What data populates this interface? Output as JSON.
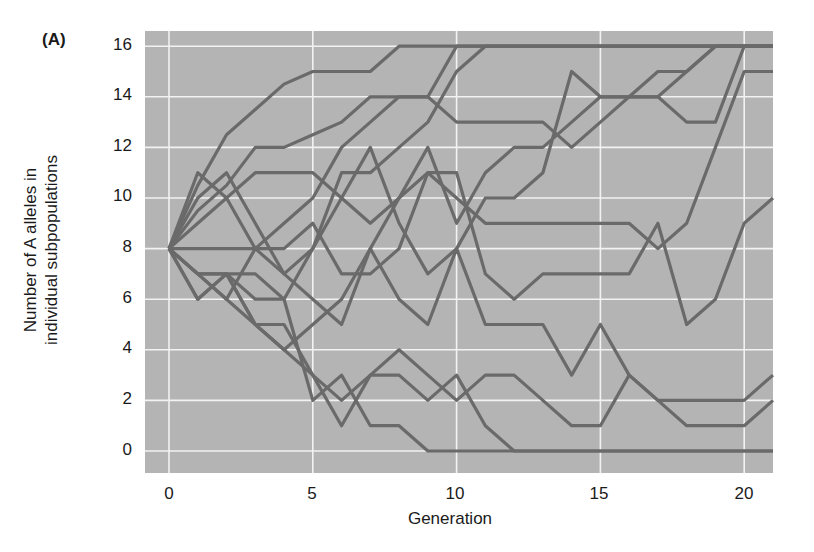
{
  "panel_label": "(A)",
  "chart_data": {
    "type": "line",
    "title": "",
    "xlabel": "Generation",
    "ylabel_line1": "Number of A alleles in",
    "ylabel_line2": "individual subpopulations",
    "xlim": [
      -0.85,
      21
    ],
    "ylim": [
      -0.9,
      16.6
    ],
    "grid": true,
    "legend": "none",
    "x_ticks": [
      0,
      5,
      10,
      15,
      20
    ],
    "y_ticks": [
      0,
      2,
      4,
      6,
      8,
      10,
      12,
      14,
      16
    ],
    "x": [
      0,
      1,
      2,
      3,
      4,
      5,
      6,
      7,
      8,
      9,
      10,
      11,
      12,
      13,
      14,
      15,
      16,
      17,
      18,
      19,
      20,
      21
    ],
    "series": [
      {
        "name": "subpop-1",
        "values": [
          8,
          10.5,
          12.5,
          13.5,
          14.5,
          15,
          15,
          15,
          16,
          16,
          16,
          16,
          16,
          16,
          16,
          16,
          16,
          16,
          16,
          16,
          16,
          16
        ]
      },
      {
        "name": "subpop-2",
        "values": [
          8,
          9.5,
          10.5,
          12,
          12,
          12.5,
          13,
          14,
          14,
          14,
          13,
          13,
          13,
          13,
          12,
          13,
          14,
          14,
          15,
          16,
          16,
          16
        ]
      },
      {
        "name": "subpop-3",
        "values": [
          8,
          9,
          10,
          11,
          11,
          11,
          10,
          9,
          10,
          11,
          10,
          9,
          9,
          9,
          9,
          9,
          9,
          8,
          9,
          12,
          15,
          15
        ]
      },
      {
        "name": "subpop-4",
        "values": [
          8,
          11,
          10,
          8,
          7,
          8,
          11,
          11,
          12,
          13,
          15,
          16,
          16,
          16,
          16,
          16,
          16,
          16,
          16,
          16,
          16,
          16
        ]
      },
      {
        "name": "subpop-5",
        "values": [
          8,
          10,
          11,
          9,
          7,
          6,
          5,
          8,
          10,
          12,
          9,
          11,
          12,
          12,
          13,
          14,
          14,
          15,
          15,
          16,
          16,
          16
        ]
      },
      {
        "name": "subpop-6",
        "values": [
          8,
          7,
          6,
          8,
          9,
          10,
          12,
          13,
          14,
          14,
          16,
          16,
          16,
          16,
          16,
          16,
          16,
          16,
          16,
          16,
          16,
          16
        ]
      },
      {
        "name": "subpop-7",
        "values": [
          8,
          7,
          7,
          7,
          6,
          8,
          10,
          12,
          9,
          7,
          8,
          10,
          10,
          11,
          15,
          14,
          14,
          14,
          13,
          13,
          16,
          16
        ]
      },
      {
        "name": "subpop-8",
        "values": [
          8,
          8,
          8,
          8,
          8,
          9,
          7,
          7,
          8,
          11,
          11,
          7,
          6,
          7,
          7,
          7,
          7,
          9,
          5,
          6,
          9,
          10
        ]
      },
      {
        "name": "subpop-9",
        "values": [
          8,
          7,
          7,
          5,
          4,
          5,
          6,
          8,
          6,
          5,
          8,
          5,
          5,
          5,
          3,
          5,
          3,
          2,
          2,
          2,
          2,
          3
        ]
      },
      {
        "name": "subpop-10",
        "values": [
          8,
          7,
          6,
          5,
          4,
          3,
          2,
          3,
          4,
          3,
          2,
          3,
          3,
          2,
          1,
          1,
          3,
          2,
          1,
          1,
          1,
          2
        ]
      },
      {
        "name": "subpop-11",
        "values": [
          8,
          6,
          7,
          5,
          5,
          3,
          1,
          3,
          3,
          2,
          3,
          1,
          0,
          0,
          0,
          0,
          0,
          0,
          0,
          0,
          0,
          0
        ]
      },
      {
        "name": "subpop-12",
        "values": [
          8,
          6,
          7,
          6,
          6,
          2,
          3,
          1,
          1,
          0,
          0,
          0,
          0,
          0,
          0,
          0,
          0,
          0,
          0,
          0,
          0,
          0
        ]
      }
    ]
  },
  "axes": {
    "x_tick_labels": [
      "0",
      "5",
      "10",
      "15",
      "20"
    ],
    "y_tick_labels": [
      "16",
      "14",
      "12",
      "10",
      "8",
      "6",
      "4",
      "2",
      "0"
    ]
  },
  "colors": {
    "plot_background": "#b4b4b4",
    "grid": "#f2f2f2",
    "line": "#6a6a6a",
    "text": "#1a1a1a"
  }
}
